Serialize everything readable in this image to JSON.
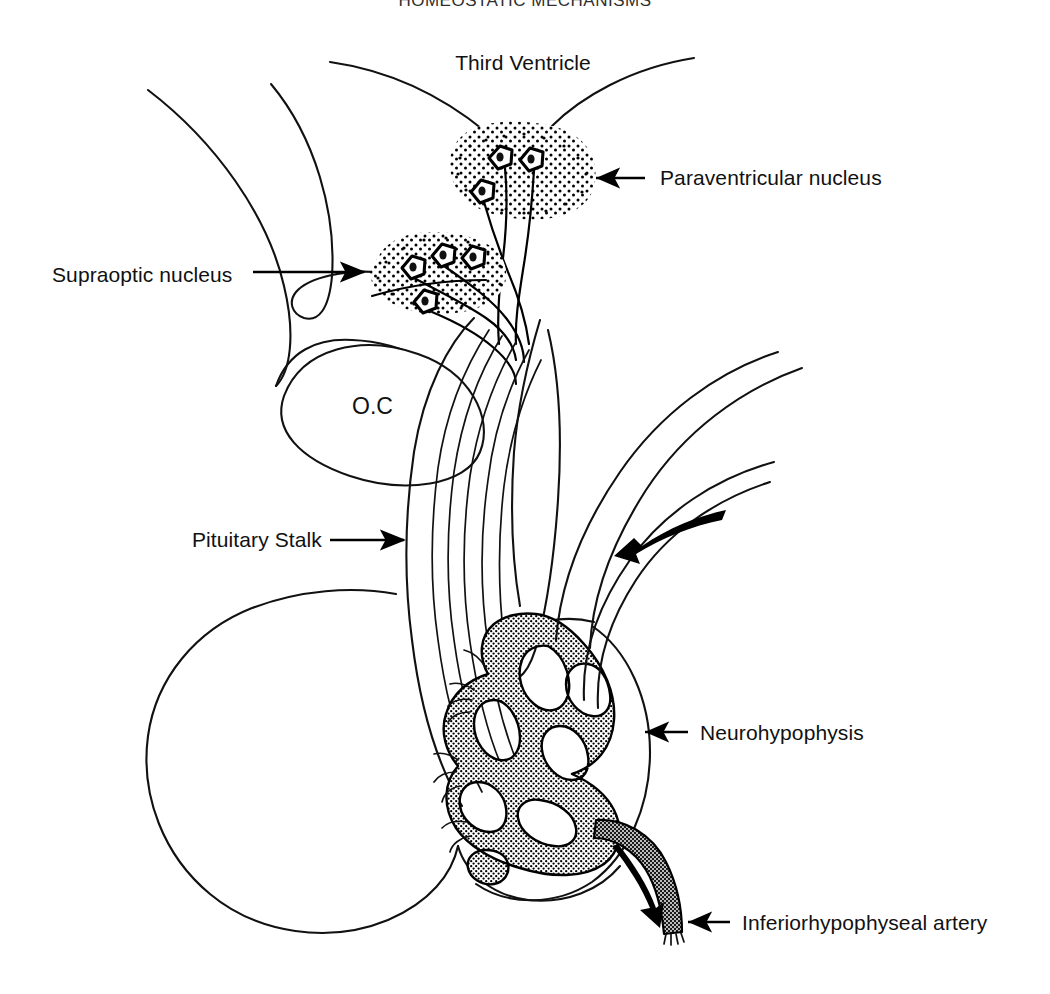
{
  "figure": {
    "title": "HOMEOSTATIC MECHANISMS",
    "background_color": "#ffffff",
    "ink_color": "#111111",
    "stipple_color": "#000000"
  },
  "labels": {
    "third_ventricle": "Third Ventricle",
    "paraventricular_nucleus": "Paraventricular nucleus",
    "supraoptic_nucleus": "Supraoptic nucleus",
    "optic_chiasm": "O.C",
    "pituitary_stalk": "Pituitary Stalk",
    "neurohypophysis": "Neurohypophysis",
    "inferiorhypophyseal_artery": "Inferiorhypophyseal artery"
  },
  "callouts": [
    {
      "id": "third-ventricle",
      "label": "Third Ventricle",
      "text_x": 523,
      "text_y": 70,
      "anchor": "middle",
      "has_arrow": false,
      "arrow_direction": "none"
    },
    {
      "id": "paraventricular-nucleus",
      "label": "Paraventricular nucleus",
      "text_x": 660,
      "text_y": 185,
      "anchor": "start",
      "has_arrow": true,
      "arrow_direction": "left",
      "arrow_from_x": 645,
      "arrow_to_x": 588,
      "arrow_y": 178
    },
    {
      "id": "supraoptic-nucleus",
      "label": "Supraoptic nucleus",
      "text_x": 52,
      "text_y": 282,
      "anchor": "start",
      "has_arrow": true,
      "arrow_direction": "right",
      "arrow_from_x": 253,
      "arrow_to_x": 372,
      "arrow_y": 272
    },
    {
      "id": "optic-chiasm",
      "label": "O.C",
      "text_x": 352,
      "text_y": 412,
      "anchor": "start",
      "has_arrow": false,
      "arrow_direction": "none"
    },
    {
      "id": "pituitary-stalk",
      "label": "Pituitary Stalk",
      "text_x": 192,
      "text_y": 547,
      "anchor": "start",
      "has_arrow": true,
      "arrow_direction": "right",
      "arrow_from_x": 330,
      "arrow_to_x": 412,
      "arrow_y": 540
    },
    {
      "id": "neurohypophysis",
      "label": "Neurohypophysis",
      "text_x": 700,
      "text_y": 740,
      "anchor": "start",
      "has_arrow": true,
      "arrow_direction": "left",
      "arrow_from_x": 688,
      "arrow_to_x": 637,
      "arrow_y": 732
    },
    {
      "id": "inferiorhypophyseal-artery",
      "label": "Inferiorhypophyseal artery",
      "text_x": 742,
      "text_y": 930,
      "anchor": "start",
      "has_arrow": true,
      "arrow_direction": "left",
      "arrow_from_x": 730,
      "arrow_to_x": 680,
      "arrow_y": 922
    }
  ],
  "structures": [
    {
      "id": "third-ventricle-walls",
      "name": "Third ventricle recess walls",
      "style": "open outline curves",
      "interactable": false
    },
    {
      "id": "hypothalamus-outline",
      "name": "Hypothalamus / brain base outline",
      "style": "open outline curves",
      "interactable": false
    },
    {
      "id": "paraventricular-nucleus-body",
      "name": "Paraventricular nucleus",
      "style": "stippled blob",
      "neuron_count": 3,
      "interactable": false
    },
    {
      "id": "supraoptic-nucleus-body",
      "name": "Supraoptic nucleus",
      "style": "stippled oval",
      "neuron_count": 4,
      "interactable": false
    },
    {
      "id": "optic-chiasm-body",
      "name": "Optic chiasm",
      "style": "white oval outline",
      "interactable": false
    },
    {
      "id": "pituitary-stalk-body",
      "name": "Pituitary stalk with hypothalamo-hypophyseal tract",
      "style": "parallel axon bundle",
      "tract_lines": 6,
      "interactable": false
    },
    {
      "id": "adenohypophysis-body",
      "name": "Anterior pituitary lobe",
      "style": "large kidney-shaped outline",
      "interactable": false
    },
    {
      "id": "neurohypophysis-body",
      "name": "Posterior pituitary lobe",
      "style": "rounded outline with stippled capillary plexus",
      "interactable": false
    },
    {
      "id": "capillary-plexus",
      "name": "Neurohypophyseal capillary plexus",
      "style": "heavy stippled vascular network",
      "interactable": false
    },
    {
      "id": "inferiorhypophyseal-artery-body",
      "name": "Inferior hypophyseal artery",
      "style": "thick stippled vessel",
      "interactable": false
    },
    {
      "id": "superior-vessel-pair",
      "name": "Upper arterial pair",
      "style": "paired outline curves",
      "interactable": false
    },
    {
      "id": "inferior-vessel-pair",
      "name": "Lower arterial pair",
      "style": "paired outline curves",
      "interactable": false
    }
  ],
  "flow_arrows": [
    {
      "id": "blood-inflow-upper",
      "name": "Upper blood flow arrow",
      "direction": "down-left",
      "tip_x": 614,
      "tip_y": 556
    },
    {
      "id": "blood-outflow-lower",
      "name": "Lower blood flow arrow",
      "direction": "down",
      "tip_x": 660,
      "tip_y": 928
    }
  ]
}
